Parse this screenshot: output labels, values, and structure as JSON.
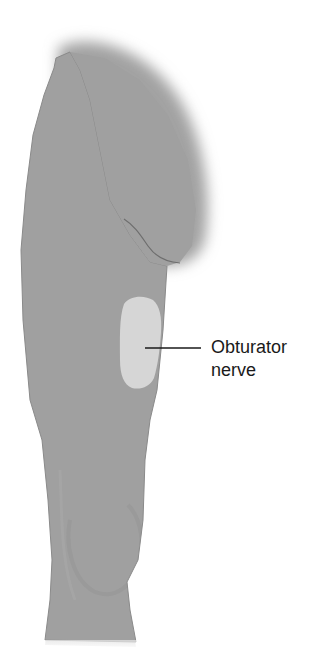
{
  "figure": {
    "colors": {
      "limb_fill": "#a0a0a0",
      "limb_edge": "#8a8a8a",
      "nerve_region_fill": "#d6d6d6",
      "fold_line": "#6e6e6e",
      "leader_line": "#1a1a1a",
      "label_text": "#1a1a1a",
      "background": "#ffffff"
    }
  },
  "label": {
    "line1": "Obturator",
    "line2": "nerve"
  },
  "leader": {
    "x1": 145,
    "y1": 348,
    "x2": 201,
    "y2": 348
  }
}
